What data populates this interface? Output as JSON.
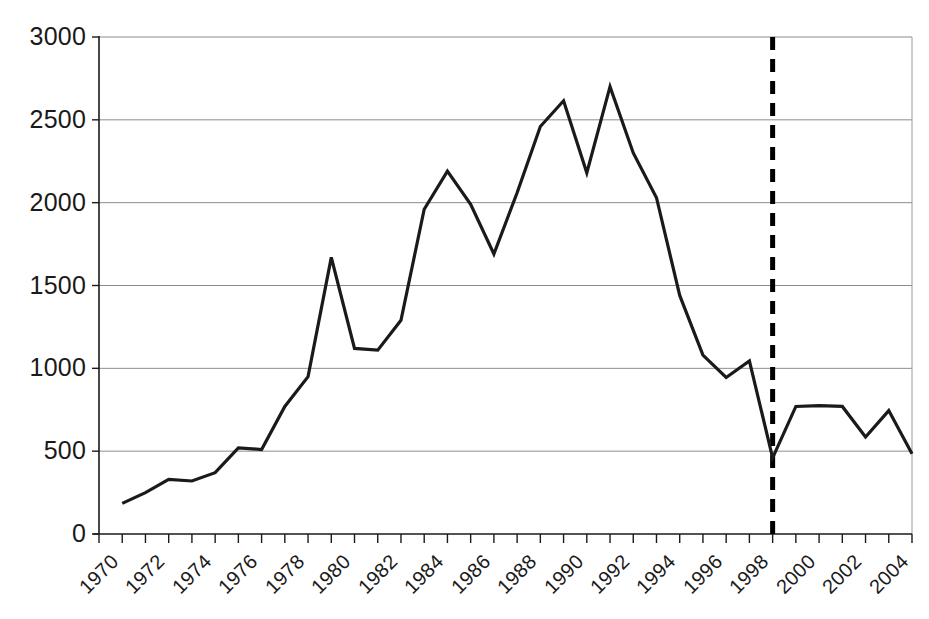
{
  "chart_data": {
    "type": "line",
    "title": "",
    "subtitle": "",
    "xlabel": "",
    "ylabel": "",
    "xlim": [
      1970,
      2005
    ],
    "ylim": [
      0,
      3000
    ],
    "grid": "horizontal",
    "legend": "none",
    "y_ticks": [
      0,
      500,
      1000,
      1500,
      2000,
      2500,
      3000
    ],
    "y_tick_labels": [
      "0",
      "500",
      "1000",
      "1500",
      "2000",
      "2500",
      "3000"
    ],
    "x_ticks": [
      1970,
      1971,
      1972,
      1973,
      1974,
      1975,
      1976,
      1977,
      1978,
      1979,
      1980,
      1981,
      1982,
      1983,
      1984,
      1985,
      1986,
      1987,
      1988,
      1989,
      1990,
      1991,
      1992,
      1993,
      1994,
      1995,
      1996,
      1997,
      1998,
      1999,
      2000,
      2001,
      2002,
      2003,
      2004,
      2005
    ],
    "x_tick_labels": [
      "1970",
      "1972",
      "1974",
      "1976",
      "1978",
      "1980",
      "1982",
      "1984",
      "1986",
      "1988",
      "1990",
      "1992",
      "1994",
      "1996",
      "1998",
      "2000",
      "2002",
      "2004"
    ],
    "x_tick_label_values": [
      1970,
      1972,
      1974,
      1976,
      1978,
      1980,
      1982,
      1984,
      1986,
      1988,
      1990,
      1992,
      1994,
      1996,
      1998,
      2000,
      2002,
      2004
    ],
    "x": [
      1971,
      1972,
      1973,
      1974,
      1975,
      1976,
      1977,
      1978,
      1979,
      1980,
      1981,
      1982,
      1983,
      1984,
      1985,
      1986,
      1987,
      1988,
      1989,
      1990,
      1991,
      1992,
      1993,
      1994,
      1995,
      1996,
      1997,
      1998,
      1999,
      2000,
      2001,
      2002,
      2003,
      2004,
      2005
    ],
    "values": [
      185,
      250,
      330,
      320,
      370,
      520,
      510,
      770,
      950,
      1670,
      1120,
      1110,
      1290,
      1960,
      2190,
      1990,
      1690,
      2060,
      2460,
      2615,
      2180,
      2700,
      2300,
      2030,
      1440,
      1080,
      945,
      1045,
      460,
      770,
      775,
      770,
      585,
      745,
      485
    ],
    "annotations": [
      {
        "name": "reference-line",
        "type": "vertical-dashed-line",
        "x": 1999,
        "style": "dashed",
        "color": "#000000"
      }
    ],
    "colors": {
      "line": "#1a1a1a",
      "grid": "#8c8c8c",
      "axis": "#1a1a1a",
      "reference": "#000000",
      "background": "#ffffff"
    }
  },
  "layout": {
    "plot_left": 99,
    "plot_right": 912,
    "plot_top": 37,
    "plot_bottom": 534,
    "width": 929,
    "height": 619
  }
}
